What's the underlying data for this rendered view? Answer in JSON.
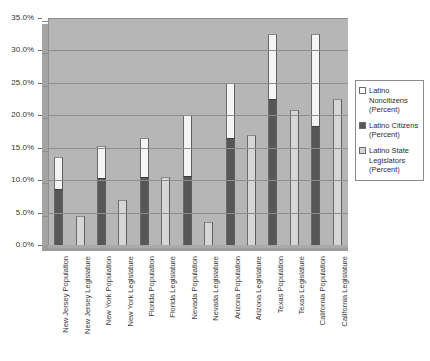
{
  "chart_data": {
    "type": "bar",
    "title": "",
    "subtitle": "",
    "xlabel": "",
    "ylabel": "",
    "ylim": [
      0,
      35
    ],
    "ytick_labels": [
      "0.0%",
      "5.0%",
      "10.0%",
      "15.0%",
      "20.0%",
      "25.0%",
      "30.0%",
      "35.0%"
    ],
    "ytick_values": [
      0,
      5,
      10,
      15,
      20,
      25,
      30,
      35
    ],
    "grid": true,
    "legend_position": "right",
    "stacked": true,
    "categories": [
      "New Jersey Population",
      "New Jersey Legislature",
      "New York Population",
      "New York Legislature",
      "Florida Population",
      "Florida Legislature",
      "Nevada Population",
      "Nevada Legislature",
      "Arizona Population",
      "Arizona Legislature",
      "Texas Population",
      "Texas Legislature",
      "California Population",
      "California Legislature"
    ],
    "series": [
      {
        "name": "Latino Noncitizens (Percent)",
        "color": "#f4f4f4",
        "values": [
          4.8,
          0,
          5.0,
          0,
          6.0,
          0,
          9.3,
          0,
          8.5,
          0,
          10.0,
          0,
          14.2,
          0
        ]
      },
      {
        "name": "Latino Citizens (Percent)",
        "color": "#575757",
        "values": [
          8.7,
          0,
          10.3,
          0,
          10.5,
          0,
          10.7,
          0,
          16.5,
          0,
          22.5,
          0,
          18.3,
          0
        ]
      },
      {
        "name": "Latino State Legislators (Percent)",
        "color": "#d6d6d6",
        "values": [
          0,
          4.5,
          0,
          7.0,
          0,
          10.5,
          0,
          3.5,
          0,
          17.0,
          0,
          20.8,
          0,
          22.5
        ]
      }
    ],
    "totals": [
      13.5,
      4.5,
      15.3,
      7.0,
      16.5,
      10.5,
      20.0,
      3.5,
      25.0,
      17.0,
      32.5,
      20.8,
      32.5,
      22.5
    ]
  },
  "legend": {
    "items": [
      {
        "label": "Latino\nNoncitizens\n(Percent)",
        "swatch": "white"
      },
      {
        "label": "Latino Citizens\n(Percent)",
        "swatch": "dark-gray"
      },
      {
        "label": "Latino State\nLegislators\n(Percent)",
        "swatch": "light-gray"
      }
    ]
  },
  "colors": {
    "plot_background": "#b6b6b6",
    "gridline": "#8d8d8d",
    "noncitizens": "#f4f4f4",
    "citizens": "#575757",
    "legislators": "#d6d6d6",
    "text": "#333333"
  }
}
